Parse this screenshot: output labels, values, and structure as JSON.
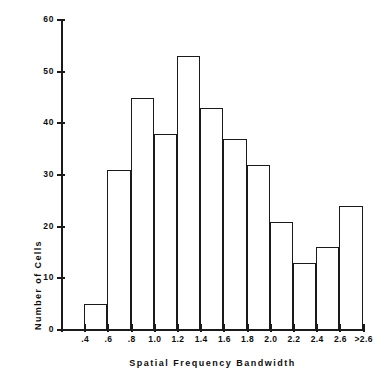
{
  "chart_data": {
    "type": "bar",
    "title": "",
    "xlabel": "Spatial Frequency Bandwidth",
    "ylabel": "Number of Cells",
    "categories": [
      ".4-.6",
      ".6-.8",
      ".8-1.0",
      "1.0-1.2",
      "1.2-1.4",
      "1.4-1.6",
      "1.6-1.8",
      "1.8-2.0",
      "2.0-2.2",
      "2.2-2.4",
      "2.4-2.6",
      "2.6->2.6"
    ],
    "values": [
      5,
      31,
      45,
      38,
      53,
      43,
      37,
      32,
      21,
      13,
      16,
      24
    ],
    "bin_edges": [
      0.4,
      0.6,
      0.8,
      1.0,
      1.2,
      1.4,
      1.6,
      1.8,
      2.0,
      2.2,
      2.4,
      2.6,
      2.8
    ],
    "xtick_labels": [
      ".2",
      ".4",
      ".6",
      ".8",
      "1.0",
      "1.2",
      "1.4",
      "1.6",
      "1.8",
      "2.0",
      "2.2",
      "2.4",
      "2.6",
      ">2.6"
    ],
    "ytick_labels": [
      "0",
      "10",
      "20",
      "30",
      "40",
      "50",
      "60"
    ],
    "ytick_values": [
      0,
      10,
      20,
      30,
      40,
      50,
      60
    ],
    "ylim": [
      0,
      60
    ],
    "xlim": [
      0.2,
      2.8
    ],
    "grid": false,
    "legend": null,
    "bar_fill": "#ffffff",
    "bar_stroke": "#1a1a1a",
    "axis_color": "#1a1a1a",
    "background": "#ffffff"
  }
}
